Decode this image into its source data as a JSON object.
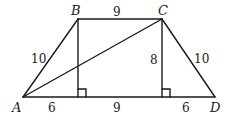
{
  "figure": {
    "type": "trapezoid",
    "stroke_color": "#1a1a1a",
    "vertices": {
      "A": {
        "label": "A",
        "x": 23,
        "y": 97
      },
      "B": {
        "label": "B",
        "x": 78,
        "y": 19
      },
      "C": {
        "label": "C",
        "x": 162,
        "y": 19
      },
      "D": {
        "label": "D",
        "x": 215,
        "y": 97
      }
    },
    "feet": {
      "B_foot": {
        "x": 78,
        "y": 97
      },
      "C_foot": {
        "x": 162,
        "y": 97
      }
    },
    "measurements": {
      "BC": "9",
      "AB": "10",
      "CD": "10",
      "height_C": "8",
      "A_to_footB": "6",
      "footB_to_footC": "9",
      "footC_to_D": "6"
    },
    "segments": [
      "AB",
      "BC",
      "CD",
      "DA",
      "AC",
      "B-altitude",
      "C-altitude"
    ],
    "right_angle_markers": 2
  }
}
